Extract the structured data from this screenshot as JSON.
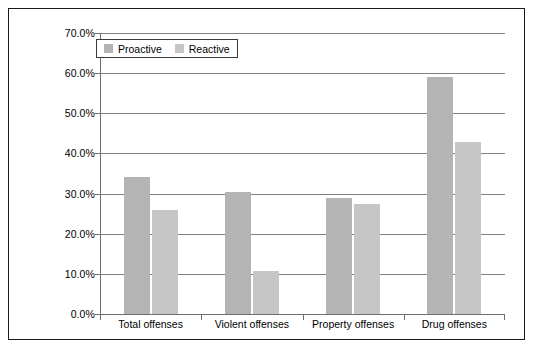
{
  "chart_data": {
    "type": "bar",
    "title": "",
    "xlabel": "",
    "ylabel": "",
    "categories": [
      "Total offenses",
      "Violent offenses",
      "Property offenses",
      "Drug offenses"
    ],
    "series": [
      {
        "name": "Proactive",
        "color": "#b4b4b4",
        "values": [
          34.2,
          30.4,
          28.8,
          59.0
        ]
      },
      {
        "name": "Reactive",
        "color": "#c6c6c6",
        "values": [
          26.0,
          10.7,
          27.3,
          42.8
        ]
      }
    ],
    "ylim": [
      0,
      70
    ],
    "ytick_values": [
      0,
      10,
      20,
      30,
      40,
      50,
      60,
      70
    ],
    "ytick_labels": [
      "0.0%",
      "10.0%",
      "20.0%",
      "30.0%",
      "40.0%",
      "50.0%",
      "60.0%",
      "70.0%"
    ],
    "grid": true,
    "legend_position": "top-left",
    "value_format": "percent"
  },
  "legend": {
    "entries": [
      {
        "label": "Proactive",
        "swatch": "legend-swatch-proactive"
      },
      {
        "label": "Reactive",
        "swatch": "legend-swatch-reactive"
      }
    ]
  }
}
